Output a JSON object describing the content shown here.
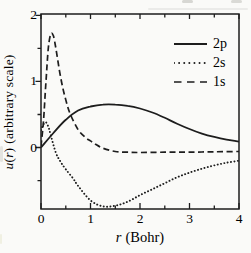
{
  "figure": {
    "background": "#fafaf8",
    "line_color": "#1d1d1d"
  },
  "labels": {
    "y_var": "u",
    "y_open": "(",
    "y_arg": "r",
    "y_close": ")",
    "y_units": "(arbitrary scale)",
    "x_var": "r",
    "x_units": "(Bohr)"
  },
  "chart_data": {
    "type": "line",
    "title": "",
    "xlabel": "r (Bohr)",
    "ylabel": "u(r) (arbitrary scale)",
    "xlim": [
      0,
      4
    ],
    "ylim": [
      -0.93,
      2.02
    ],
    "x_major_ticks": [
      0,
      1,
      2,
      3,
      4
    ],
    "x_minor_ticks": [
      0.5,
      1.5,
      2.5,
      3.5
    ],
    "y_major_ticks": [
      0,
      1,
      2
    ],
    "y_minor_ticks": [
      -0.5,
      0.5,
      1.5
    ],
    "grid": false,
    "legend_position": "top-right",
    "series": [
      {
        "name": "2p",
        "style": "solid",
        "x": [
          0,
          0.25,
          0.5,
          0.75,
          1.0,
          1.25,
          1.5,
          1.75,
          2.0,
          2.25,
          2.5,
          2.75,
          3.0,
          3.25,
          3.5,
          3.75,
          4.0
        ],
        "y": [
          0.0,
          0.22,
          0.42,
          0.56,
          0.62,
          0.65,
          0.65,
          0.63,
          0.59,
          0.53,
          0.45,
          0.36,
          0.28,
          0.21,
          0.16,
          0.12,
          0.09
        ]
      },
      {
        "name": "2s",
        "style": "dotted",
        "x": [
          0,
          0.05,
          0.1,
          0.15,
          0.2,
          0.3,
          0.4,
          0.5,
          0.65,
          0.75,
          1.0,
          1.25,
          1.5,
          1.75,
          2.0,
          2.25,
          2.5,
          2.75,
          3.0,
          3.25,
          3.5,
          3.75,
          4.0
        ],
        "y": [
          0.26,
          0.35,
          0.38,
          0.31,
          0.18,
          -0.08,
          -0.22,
          -0.33,
          -0.47,
          -0.58,
          -0.8,
          -0.89,
          -0.88,
          -0.82,
          -0.72,
          -0.63,
          -0.54,
          -0.45,
          -0.38,
          -0.32,
          -0.27,
          -0.23,
          -0.2
        ]
      },
      {
        "name": "1s",
        "style": "dashed",
        "x": [
          0,
          0.05,
          0.1,
          0.15,
          0.2,
          0.25,
          0.3,
          0.4,
          0.5,
          0.6,
          0.75,
          0.9,
          1.0,
          1.1,
          1.25,
          1.5,
          1.75,
          2.0,
          2.5,
          3.0,
          3.5,
          4.0
        ],
        "y": [
          0.02,
          0.4,
          1.0,
          1.52,
          1.72,
          1.69,
          1.5,
          1.05,
          0.72,
          0.49,
          0.27,
          0.15,
          0.1,
          0.05,
          -0.01,
          -0.06,
          -0.07,
          -0.075,
          -0.07,
          -0.07,
          -0.065,
          -0.06
        ]
      }
    ]
  }
}
